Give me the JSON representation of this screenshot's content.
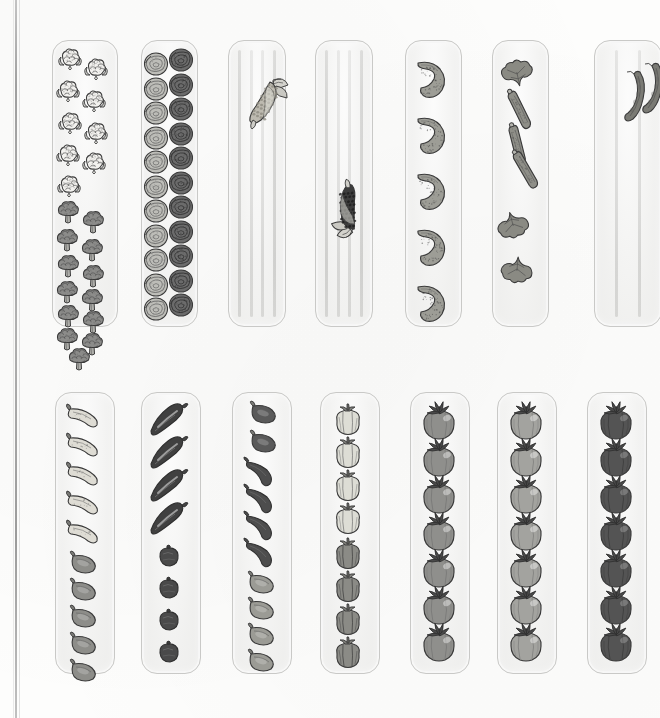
{
  "illustration": {
    "title": "Vegetable Garden Bed Planting Plan",
    "style": "hand-drawn grayscale watercolor and ink illustration",
    "page_background": "#fdfdfc",
    "bed_fill": "#f2f2f1",
    "bed_outline": "#c9c9c7",
    "binding_line_color": "#8f8f8f",
    "rows": 2,
    "beds_per_row": 7,
    "total_beds": 14
  },
  "beds": [
    {
      "index": 1,
      "name": "cauliflower-and-broccoli-bed",
      "x": 52,
      "y": 40,
      "w": 64,
      "h": 285,
      "stripes": 0,
      "crops": [
        {
          "crop": "cauliflower",
          "count": 9,
          "color": "#f3f2ef",
          "shade": "white"
        },
        {
          "crop": "broccoli",
          "count": 13,
          "color": "#8c8c8a",
          "shade": "medium-gray"
        }
      ]
    },
    {
      "index": 2,
      "name": "cabbage-bed",
      "x": 141,
      "y": 40,
      "w": 55,
      "h": 285,
      "stripes": 0,
      "crops": [
        {
          "crop": "green cabbage",
          "count": 11,
          "color": "#bdbdb8",
          "shade": "light-gray"
        },
        {
          "crop": "red cabbage",
          "count": 11,
          "color": "#6b6b6b",
          "shade": "dark-gray"
        }
      ]
    },
    {
      "index": 3,
      "name": "sweet-corn-bed",
      "x": 228,
      "y": 40,
      "w": 56,
      "h": 285,
      "stripes": 4,
      "crops": [
        {
          "crop": "sweet corn",
          "count": 1,
          "color": "#b8b5ac",
          "shade": "light"
        }
      ]
    },
    {
      "index": 4,
      "name": "popcorn-bed",
      "x": 315,
      "y": 40,
      "w": 56,
      "h": 285,
      "stripes": 4,
      "crops": [
        {
          "crop": "dark popcorn",
          "count": 1,
          "color": "#3d3d3d",
          "shade": "very-dark"
        }
      ]
    },
    {
      "index": 5,
      "name": "cucumber-bed",
      "x": 405,
      "y": 40,
      "w": 55,
      "h": 285,
      "stripes": 0,
      "crops": [
        {
          "crop": "cucumber",
          "count": 5,
          "color": "#9d9d96",
          "shade": "medium"
        }
      ]
    },
    {
      "index": 6,
      "name": "zucchini-squash-bed",
      "x": 492,
      "y": 40,
      "w": 55,
      "h": 285,
      "stripes": 0,
      "crops": [
        {
          "crop": "zucchini",
          "count": 3,
          "color": "#8f8f88",
          "shade": "medium"
        },
        {
          "crop": "squash blossom leaves",
          "count": 2,
          "color": "#8a8a83",
          "shade": "medium"
        }
      ]
    },
    {
      "index": 7,
      "name": "bean-bed",
      "x": 594,
      "y": 40,
      "w": 66,
      "h": 285,
      "stripes": 2,
      "crops": [
        {
          "crop": "pole beans",
          "count": 2,
          "color": "#7a7a74",
          "shade": "medium-dark"
        }
      ]
    },
    {
      "index": 8,
      "name": "banana-and-jalapeno-pepper-bed",
      "x": 55,
      "y": 392,
      "w": 58,
      "h": 280,
      "stripes": 0,
      "crops": [
        {
          "crop": "banana pepper",
          "count": 5,
          "color": "#dedcd4",
          "shade": "very-light"
        },
        {
          "crop": "jalapeno pepper",
          "count": 5,
          "color": "#8d8d89",
          "shade": "medium"
        }
      ]
    },
    {
      "index": 9,
      "name": "dark-chile-pepper-bed",
      "x": 141,
      "y": 392,
      "w": 58,
      "h": 280,
      "stripes": 0,
      "crops": [
        {
          "crop": "poblano chile",
          "count": 4,
          "color": "#404040",
          "shade": "very-dark"
        },
        {
          "crop": "round hot pepper",
          "count": 4,
          "color": "#4a4a4a",
          "shade": "dark"
        }
      ]
    },
    {
      "index": 10,
      "name": "mixed-hot-pepper-bed",
      "x": 232,
      "y": 392,
      "w": 58,
      "h": 280,
      "stripes": 0,
      "crops": [
        {
          "crop": "dark jalapeno",
          "count": 2,
          "color": "#5a5a5a",
          "shade": "dark"
        },
        {
          "crop": "cayenne chile",
          "count": 4,
          "color": "#4d4d4d",
          "shade": "dark"
        },
        {
          "crop": "pale jalapeno",
          "count": 4,
          "color": "#9b9b95",
          "shade": "medium"
        }
      ]
    },
    {
      "index": 11,
      "name": "bell-pepper-bed",
      "x": 320,
      "y": 392,
      "w": 58,
      "h": 280,
      "stripes": 0,
      "crops": [
        {
          "crop": "yellow bell pepper",
          "count": 4,
          "color": "#ddddd5",
          "shade": "light"
        },
        {
          "crop": "red bell pepper",
          "count": 4,
          "color": "#8b8b86",
          "shade": "medium"
        }
      ]
    },
    {
      "index": 12,
      "name": "tomato-bed-a",
      "x": 410,
      "y": 392,
      "w": 58,
      "h": 280,
      "stripes": 0,
      "crops": [
        {
          "crop": "tomato",
          "count": 7,
          "color": "#8f8f8c",
          "shade": "medium"
        }
      ]
    },
    {
      "index": 13,
      "name": "tomato-bed-b",
      "x": 497,
      "y": 392,
      "w": 58,
      "h": 280,
      "stripes": 0,
      "crops": [
        {
          "crop": "tomato",
          "count": 7,
          "color": "#a3a39f",
          "shade": "light-medium"
        }
      ]
    },
    {
      "index": 14,
      "name": "tomato-bed-c",
      "x": 587,
      "y": 392,
      "w": 58,
      "h": 280,
      "stripes": 0,
      "crops": [
        {
          "crop": "tomato",
          "count": 7,
          "color": "#545454",
          "shade": "dark"
        }
      ]
    }
  ]
}
